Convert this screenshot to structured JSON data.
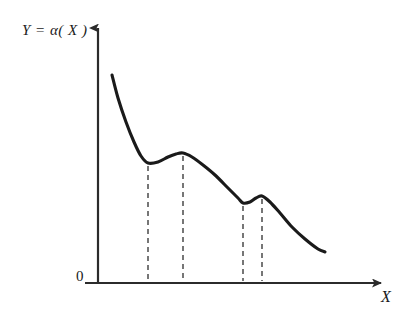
{
  "figure": {
    "title": "",
    "y_axis_label": "Y = α( X )",
    "x_axis_label": "X",
    "origin_label": "0",
    "line_color": "#1a1a1a",
    "axis_color": "#2b2b2b",
    "dash_color": "#4a4a4a",
    "background_color": "#ffffff"
  },
  "chart_data": {
    "type": "line",
    "title": "",
    "xlabel": "X",
    "ylabel": "Y = α( X )",
    "grid": false,
    "legend": null,
    "axis_origin_label": "0",
    "xlim": [
      98,
      390
    ],
    "ylim": [
      283,
      20
    ],
    "series": [
      {
        "name": "α(X)",
        "style": "solid",
        "color": "#1a1a1a",
        "x": [
          112,
          118,
          126,
          134,
          141,
          148,
          158,
          168,
          176,
          183,
          192,
          203,
          215,
          228,
          238,
          243,
          250,
          256,
          262,
          270,
          280,
          292,
          305,
          318,
          325
        ],
        "y": [
          75,
          98,
          122,
          142,
          156,
          163,
          162,
          157,
          154,
          153,
          157,
          165,
          175,
          188,
          198,
          203,
          202,
          198,
          196,
          202,
          213,
          227,
          239,
          249,
          252
        ]
      }
    ],
    "annotations": [
      {
        "name": "dashed-drop-line-1",
        "type": "vline",
        "x": 148,
        "y_top": 163,
        "y_bottom": 283,
        "style": "dashed",
        "label": "first local minimum"
      },
      {
        "name": "dashed-drop-line-2",
        "type": "vline",
        "x": 183,
        "y_top": 153,
        "y_bottom": 283,
        "style": "dashed",
        "label": "first local maximum"
      },
      {
        "name": "dashed-drop-line-3",
        "type": "vline",
        "x": 243,
        "y_top": 203,
        "y_bottom": 283,
        "style": "dashed",
        "label": "second local minimum"
      },
      {
        "name": "dashed-drop-line-4",
        "type": "vline",
        "x": 262,
        "y_top": 196,
        "y_bottom": 283,
        "style": "dashed",
        "label": "second local maximum"
      }
    ],
    "critical_points": [
      {
        "kind": "local-minimum",
        "x": 148,
        "y": 163
      },
      {
        "kind": "local-maximum",
        "x": 183,
        "y": 153
      },
      {
        "kind": "local-minimum",
        "x": 243,
        "y": 203
      },
      {
        "kind": "local-maximum",
        "x": 262,
        "y": 196
      }
    ],
    "axes": {
      "y_axis": {
        "x": 98,
        "y_start": 283,
        "y_end": 20,
        "arrow": true
      },
      "x_axis": {
        "y": 283,
        "x_start": 85,
        "x_end": 390,
        "arrow": true
      }
    }
  }
}
